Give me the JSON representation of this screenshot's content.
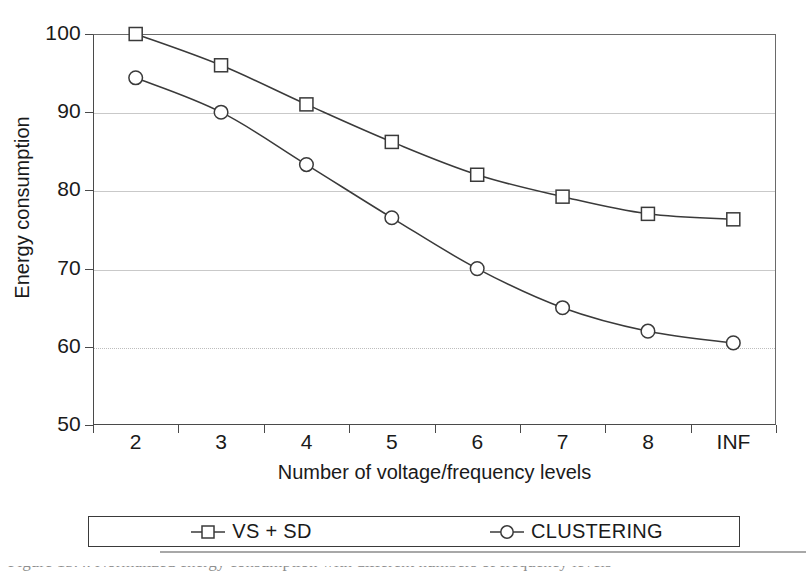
{
  "chart_data": {
    "type": "line",
    "title": "",
    "xlabel": "Number of voltage/frequency levels",
    "ylabel": "Energy consumption",
    "categories": [
      "2",
      "3",
      "4",
      "5",
      "6",
      "7",
      "8",
      "INF"
    ],
    "ylim": [
      50,
      100
    ],
    "yticks": [
      50,
      60,
      70,
      80,
      90,
      100
    ],
    "grid": "horizontal",
    "legend_position": "bottom",
    "series": [
      {
        "name": "VS + SD",
        "marker": "open-square",
        "values": [
          100,
          96,
          91,
          86.2,
          82,
          79.2,
          77,
          76.3
        ]
      },
      {
        "name": "CLUSTERING",
        "marker": "open-circle",
        "values": [
          94.4,
          90,
          83.3,
          76.5,
          70,
          65,
          62,
          60.5
        ]
      }
    ]
  },
  "axes": {
    "y_title": "Energy consumption",
    "x_title": "Number of voltage/frequency levels",
    "y_tick_labels": [
      "100",
      "90",
      "80",
      "70",
      "60",
      "50"
    ],
    "x_tick_labels": [
      "2",
      "3",
      "4",
      "5",
      "6",
      "7",
      "8",
      "INF"
    ]
  },
  "legend": {
    "entries": [
      {
        "label": "VS + SD",
        "marker": "open-square"
      },
      {
        "label": "CLUSTERING",
        "marker": "open-circle"
      }
    ]
  },
  "caption": {
    "partial_text": "Figure 15.4.  Normalized energy consumption with different numbers of frequency levels"
  },
  "colors": {
    "line": "#3a3a3a",
    "marker_fill": "#ffffff",
    "grid": "#c9c9c9",
    "axis": "#4a4a4a",
    "text": "#1a1a1a",
    "background": "#ffffff"
  }
}
